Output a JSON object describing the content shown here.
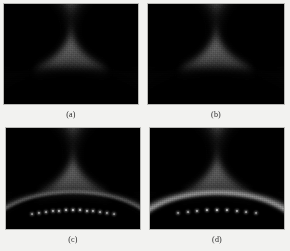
{
  "figure": {
    "background_color": "#f2f2f0",
    "panel_border_color": "#b9b9b6",
    "layout": "2x2 grid of grayscale field intensity maps",
    "caption_color": "#2a2a2a"
  },
  "chart_data": {
    "type": "heatmap",
    "title": "",
    "subtitle": "",
    "xlabel": "",
    "ylabel": "",
    "colormap": "grayscale",
    "legend": "none",
    "grid": false,
    "panel_count": 4,
    "panels": [
      {
        "label": "(a)",
        "position": "top-left",
        "description": "Grayscale intensity field: dark upper-left and upper-right corner lobes, bright inverted-Y trunk down the center, dark bottom lobe.",
        "peak_intensity": 0.62,
        "background_intensity": 0.02,
        "plateau_intensity": 0.33,
        "bright_bottom_arc": false,
        "arc_nodes": 0
      },
      {
        "label": "(b)",
        "position": "top-right",
        "description": "Same field structure as (a) with a slightly wider bright plateau and fainter upper trunk.",
        "peak_intensity": 0.58,
        "background_intensity": 0.02,
        "plateau_intensity": 0.32,
        "bright_bottom_arc": false,
        "arc_nodes": 0
      },
      {
        "label": "(c)",
        "position": "bottom-left",
        "description": "Same field structure with a dotted bright rim of discrete nodes along the lower dark lobe boundary.",
        "peak_intensity": 0.66,
        "background_intensity": 0.02,
        "plateau_intensity": 0.31,
        "bright_bottom_arc": true,
        "arc_nodes": 13
      },
      {
        "label": "(d)",
        "position": "bottom-right",
        "description": "Same field structure with a brighter, more diffuse arc along the lower dark lobe boundary.",
        "peak_intensity": 0.72,
        "background_intensity": 0.02,
        "plateau_intensity": 0.36,
        "bright_bottom_arc": true,
        "arc_nodes": 9
      }
    ]
  },
  "captions": {
    "a": "(a)",
    "b": "(b)",
    "c": "(c)",
    "d": "(d)"
  }
}
